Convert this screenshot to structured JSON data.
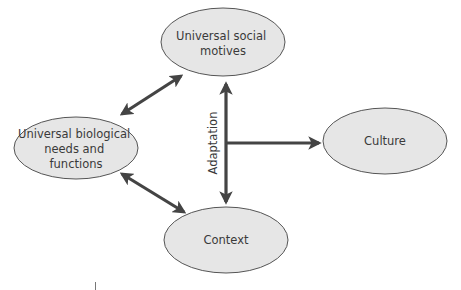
{
  "diagram": {
    "colors": {
      "node_fill": "#e6e6e6",
      "node_stroke": "#555555",
      "arrow": "#444444",
      "text": "#3a3a3a"
    },
    "nodes": [
      {
        "id": "social",
        "lines": [
          "Universal social",
          "motives"
        ]
      },
      {
        "id": "biological",
        "lines": [
          "Universal biological",
          "needs and",
          "functions"
        ]
      },
      {
        "id": "culture",
        "lines": [
          "Culture"
        ]
      },
      {
        "id": "context",
        "lines": [
          "Context"
        ]
      }
    ],
    "edges": [
      {
        "from": "biological",
        "to": "social",
        "type": "bidirectional"
      },
      {
        "from": "biological",
        "to": "context",
        "type": "bidirectional"
      },
      {
        "from": "social",
        "to": "context",
        "type": "bidirectional",
        "label": "Adaptation"
      },
      {
        "from": "adaptation-axis",
        "to": "culture",
        "type": "directed"
      }
    ],
    "adaptation_label": "Adaptation"
  }
}
